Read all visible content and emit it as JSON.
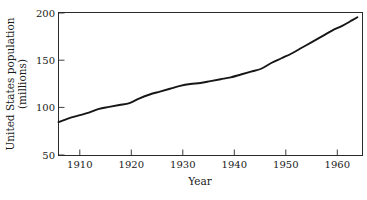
{
  "chart_data": {
    "type": "line",
    "title": "",
    "xlabel": "Year",
    "ylabel": "United States population (millions)",
    "ylabel_line1": "United States population",
    "ylabel_line2": "(millions)",
    "xlim": [
      1906,
      1966
    ],
    "ylim": [
      50,
      200
    ],
    "grid": false,
    "legend": null,
    "xticks": [
      1910,
      1920,
      1930,
      1940,
      1950,
      1960
    ],
    "xtick_labels": [
      "1910",
      "1920",
      "1930",
      "1940",
      "1950",
      "1960"
    ],
    "yticks": [
      50,
      100,
      150,
      200
    ],
    "ytick_labels": [
      "50",
      "100",
      "150",
      "200"
    ],
    "series": [
      {
        "name": "United States population",
        "color": "#161616",
        "x": [
          1906,
          1908,
          1910,
          1912,
          1914,
          1916,
          1918,
          1920,
          1922,
          1924,
          1926,
          1928,
          1930,
          1932,
          1934,
          1936,
          1938,
          1940,
          1942,
          1944,
          1946,
          1948,
          1950,
          1952,
          1954,
          1956,
          1958,
          1960,
          1962,
          1964,
          1965
        ],
        "values": [
          85,
          89,
          92,
          95,
          99,
          101,
          103,
          105,
          110,
          114,
          117,
          120,
          123,
          125,
          126,
          128,
          130,
          132,
          135,
          138,
          141,
          147,
          152,
          157,
          163,
          169,
          175,
          181,
          186,
          192,
          195
        ]
      }
    ]
  },
  "axes": {
    "x_axis_label": "Year",
    "y_axis_label_top": "United States population",
    "y_axis_label_bottom": "(millions)"
  },
  "colors": {
    "curve": "#161616",
    "frame": "#2a2a2a",
    "background": "#ffffff",
    "text": "#1a1a1a"
  }
}
